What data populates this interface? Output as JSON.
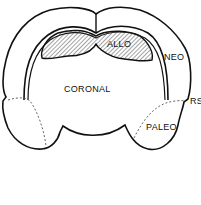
{
  "diagram": {
    "labels": {
      "allo": "ALLO",
      "neo": "NEO",
      "coronal": "CORONAL",
      "rs": "RS",
      "paleo": "PALEO"
    },
    "colors": {
      "stroke": "#111111",
      "background": "#ffffff",
      "hatch": "#333333",
      "dashed": "#555555"
    }
  }
}
